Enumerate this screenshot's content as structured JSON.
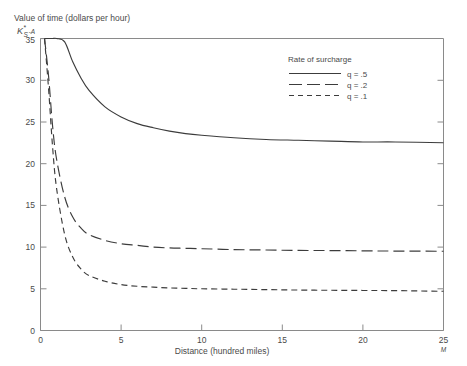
{
  "figure": {
    "background_color": "#ffffff",
    "ink_color": "#3c3c3c",
    "axis_color": "#8a8a8a"
  },
  "axes": {
    "y_axis_title": "Value of time (dollars per hour)",
    "y_axis_symbol_main": "K",
    "y_axis_symbol_sub": "S",
    "y_axis_symbol_sup": "*",
    "y_axis_symbol_tail": "-A",
    "x_axis_title": "Distance (hundred miles)",
    "x_axis_end_marker": "M",
    "y_ticks": [
      0,
      5,
      10,
      15,
      20,
      25,
      30,
      35
    ],
    "x_ticks": [
      0,
      5,
      10,
      15,
      20,
      25
    ],
    "ylim": [
      0,
      35
    ],
    "xlim": [
      0,
      25
    ]
  },
  "legend": {
    "title": "Rate of surcharge",
    "position": "top-right-inside",
    "entries": [
      {
        "label": "q = .5",
        "style": "solid"
      },
      {
        "label": "q = .2",
        "style": "long-dash"
      },
      {
        "label": "q = .1",
        "style": "short-dash"
      }
    ]
  },
  "chart_data": {
    "type": "line",
    "title": "",
    "subtitle": "",
    "xlabel": "Distance (hundred miles)",
    "ylabel": "Value of time (dollars per hour)",
    "xlim": [
      0,
      25
    ],
    "ylim": [
      0,
      35
    ],
    "grid": false,
    "legend_position": "top-right-inside",
    "legend_title": "Rate of surcharge",
    "x": [
      0.25,
      0.5,
      0.75,
      1,
      1.5,
      2,
      2.5,
      3,
      4,
      5,
      6,
      7,
      8,
      9,
      10,
      12,
      14,
      16,
      18,
      20,
      22,
      25
    ],
    "series": [
      {
        "name": "q = .5",
        "style": "solid",
        "asymptote": 22.5,
        "values": [
          35.0,
          35.0,
          35.0,
          35.0,
          34.6,
          32.2,
          30.3,
          28.8,
          26.8,
          25.6,
          24.8,
          24.3,
          23.9,
          23.6,
          23.4,
          23.1,
          22.9,
          22.8,
          22.7,
          22.6,
          22.6,
          22.5
        ]
      },
      {
        "name": "q = .2",
        "style": "long-dash",
        "asymptote": 9.5,
        "values": [
          35.0,
          30.5,
          24.5,
          20.5,
          16.0,
          13.6,
          12.3,
          11.5,
          10.8,
          10.4,
          10.2,
          10.0,
          9.9,
          9.85,
          9.8,
          9.7,
          9.65,
          9.6,
          9.58,
          9.55,
          9.52,
          9.5
        ]
      },
      {
        "name": "q = .1",
        "style": "short-dash",
        "asymptote": 4.7,
        "values": [
          35.0,
          29.0,
          22.0,
          17.0,
          11.5,
          8.8,
          7.4,
          6.6,
          5.9,
          5.5,
          5.3,
          5.2,
          5.1,
          5.05,
          5.0,
          4.95,
          4.9,
          4.85,
          4.82,
          4.8,
          4.78,
          4.7
        ]
      }
    ]
  }
}
